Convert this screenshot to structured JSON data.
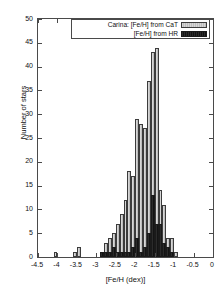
{
  "chart_data": {
    "type": "bar",
    "title": "",
    "xlabel": "[Fe/H (dex)]",
    "ylabel": "Number of stars",
    "xlim": [
      -4.5,
      0
    ],
    "ylim": [
      0,
      50
    ],
    "bin_width": 0.1,
    "grid": false,
    "legend_position": "top-right inside",
    "xticks": [
      "-4.5",
      "-4",
      "-3.5",
      "-3",
      "-2.5",
      "-2",
      "-1.5",
      "-1",
      "-0.5",
      "0"
    ],
    "xtick_values": [
      -4.5,
      -4,
      -3.5,
      -3,
      -2.5,
      -2,
      -1.5,
      -1,
      -0.5,
      0
    ],
    "yticks": [
      "0",
      "5",
      "10",
      "15",
      "20",
      "25",
      "30",
      "35",
      "40",
      "45",
      "50"
    ],
    "ytick_values": [
      0,
      5,
      10,
      15,
      20,
      25,
      30,
      35,
      40,
      45,
      50
    ],
    "series": [
      {
        "name": "Carina: [Fe/H] from CaT",
        "style": "light-hatched",
        "color": "#c8c8c8",
        "bins": [
          -4.1,
          -3.6,
          -3.5,
          -2.9,
          -2.8,
          -2.7,
          -2.6,
          -2.5,
          -2.4,
          -2.3,
          -2.2,
          -2.1,
          -2.0,
          -1.9,
          -1.8,
          -1.7,
          -1.6,
          -1.5,
          -1.4,
          -1.3,
          -1.2,
          -1.1,
          -1.0
        ],
        "values": [
          1,
          1,
          2,
          1,
          3,
          4,
          5,
          7,
          9,
          12,
          18,
          17,
          29,
          28,
          27,
          37,
          43,
          44,
          14,
          11,
          4,
          4,
          1
        ]
      },
      {
        "name": "[Fe/H] from HR",
        "style": "dark-solid",
        "color": "#1a1a1a",
        "bins": [
          -2.9,
          -2.8,
          -2.7,
          -2.6,
          -2.5,
          -2.4,
          -2.3,
          -2.2,
          -2.1,
          -2.0,
          -1.9,
          -1.8,
          -1.7,
          -1.6,
          -1.5,
          -1.4,
          -1.3,
          -1.2,
          -1.1,
          -1.0
        ],
        "values": [
          1,
          1,
          1,
          2,
          1,
          1,
          1,
          1,
          2,
          4,
          1,
          2,
          5,
          13,
          7,
          7,
          3,
          2,
          1,
          0
        ]
      }
    ]
  },
  "legend": {
    "entries": [
      {
        "label": "Carina: [Fe/H] from CaT",
        "swatch": "cat"
      },
      {
        "label": "[Fe/H] from HR",
        "swatch": "hr"
      }
    ]
  },
  "axes": {
    "x_title": "[Fe/H (dex)]",
    "y_title": "Number of stars"
  }
}
